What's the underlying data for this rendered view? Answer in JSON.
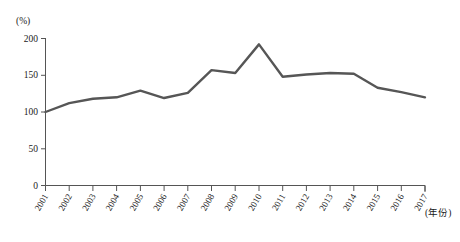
{
  "chart_data": {
    "type": "line",
    "title": "",
    "subtitle": "",
    "xlabel": "(年份)",
    "ylabel": "(%)",
    "categories": [
      "2001",
      "2002",
      "2003",
      "2004",
      "2005",
      "2006",
      "2007",
      "2008",
      "2009",
      "2010",
      "2011",
      "2012",
      "2013",
      "2014",
      "2015",
      "2016",
      "2017"
    ],
    "values": [
      100,
      112,
      118,
      120,
      129,
      119,
      126,
      157,
      153,
      192,
      148,
      151,
      153,
      152,
      133,
      127,
      120
    ],
    "series": [
      {
        "name": "",
        "values": [
          100,
          112,
          118,
          120,
          129,
          119,
          126,
          157,
          153,
          192,
          148,
          151,
          153,
          152,
          133,
          127,
          120
        ]
      }
    ],
    "ylim": [
      0,
      200
    ],
    "yticks": [
      0,
      50,
      100,
      150,
      200
    ],
    "ytick_labels": [
      "0",
      "50",
      "100",
      "150",
      "200"
    ],
    "grid": false,
    "legend": false,
    "legend_position": "none",
    "line_color": "#565656"
  },
  "axis": {
    "y_unit_label": "(%)",
    "x_unit_label": "(年份)",
    "y_tick_0": "0",
    "y_tick_50": "50",
    "y_tick_100": "100",
    "y_tick_150": "150",
    "y_tick_200": "200"
  },
  "x_labels": {
    "l0": "2001",
    "l1": "2002",
    "l2": "2003",
    "l3": "2004",
    "l4": "2005",
    "l5": "2006",
    "l6": "2007",
    "l7": "2008",
    "l8": "2009",
    "l9": "2010",
    "l10": "2011",
    "l11": "2012",
    "l12": "2013",
    "l13": "2014",
    "l14": "2015",
    "l15": "2016",
    "l16": "2017"
  }
}
